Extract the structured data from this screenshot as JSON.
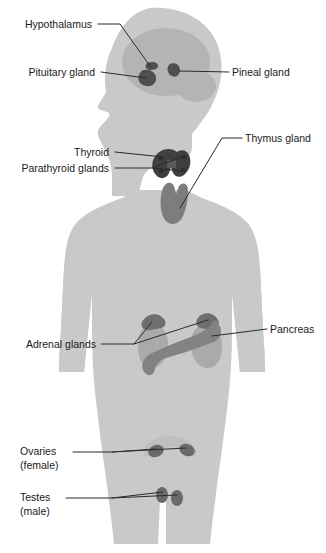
{
  "figure": {
    "orientation": "anterior body silhouette with left-facing head profile"
  },
  "colors": {
    "background": "#ffffff",
    "body_fill": "#c9c9c9",
    "body_fill_light": "#d0d0d0",
    "brain_fill": "#b4b4b4",
    "organ_mid": "#9a9a9a",
    "organ_dark": "#6e6e6e",
    "organ_darkest": "#4f4f4f",
    "uterus_faint": "#bcbcbc",
    "leader_line": "#2b2b2b",
    "label_text": "#1a1a1a"
  },
  "labels": [
    {
      "id": "hypothalamus",
      "text": "Hypothalamus",
      "lines": [
        "Hypothalamus"
      ],
      "side": "left",
      "align": "end",
      "x": 92,
      "y": 28,
      "region": "brain"
    },
    {
      "id": "pituitary-gland",
      "text": "Pituitary gland",
      "lines": [
        "Pituitary gland"
      ],
      "side": "left",
      "align": "end",
      "x": 95,
      "y": 76,
      "region": "brain"
    },
    {
      "id": "pineal-gland",
      "text": "Pineal gland",
      "lines": [
        "Pineal gland"
      ],
      "side": "right",
      "align": "start",
      "x": 232,
      "y": 76,
      "region": "brain"
    },
    {
      "id": "thyroid",
      "text": "Thyroid",
      "lines": [
        "Thyroid"
      ],
      "side": "left",
      "align": "end",
      "x": 109,
      "y": 156,
      "region": "neck"
    },
    {
      "id": "parathyroid-glands",
      "text": "Parathyroid glands",
      "lines": [
        "Parathyroid glands"
      ],
      "side": "left",
      "align": "end",
      "x": 109,
      "y": 172,
      "region": "neck"
    },
    {
      "id": "thymus-gland",
      "text": "Thymus gland",
      "lines": [
        "Thymus gland"
      ],
      "side": "right",
      "align": "start",
      "x": 245,
      "y": 142,
      "region": "chest"
    },
    {
      "id": "adrenal-glands",
      "text": "Adrenal glands",
      "lines": [
        "Adrenal glands"
      ],
      "side": "left",
      "align": "end",
      "x": 96,
      "y": 348,
      "region": "abdomen"
    },
    {
      "id": "pancreas",
      "text": "Pancreas",
      "lines": [
        "Pancreas"
      ],
      "side": "right",
      "align": "start",
      "x": 270,
      "y": 333,
      "region": "abdomen"
    },
    {
      "id": "ovaries",
      "text": "Ovaries (female)",
      "lines": [
        "Ovaries",
        "(female)"
      ],
      "side": "left",
      "align": "start",
      "x": 20,
      "y": 455,
      "region": "pelvis"
    },
    {
      "id": "testes",
      "text": "Testes (male)",
      "lines": [
        "Testes",
        "(male)"
      ],
      "side": "left",
      "align": "start",
      "x": 20,
      "y": 501,
      "region": "pelvis"
    }
  ],
  "glands": [
    {
      "id": "hypothalamus",
      "name": "Hypothalamus",
      "shade": "organ_darkest"
    },
    {
      "id": "pituitary-gland",
      "name": "Pituitary gland",
      "shade": "organ_darkest"
    },
    {
      "id": "pineal-gland",
      "name": "Pineal gland",
      "shade": "organ_darkest"
    },
    {
      "id": "thyroid",
      "name": "Thyroid",
      "shade": "organ_darkest"
    },
    {
      "id": "parathyroid-glands",
      "name": "Parathyroid glands",
      "shade": "organ_darkest"
    },
    {
      "id": "thymus-gland",
      "name": "Thymus gland",
      "shade": "organ_dark"
    },
    {
      "id": "adrenal-glands",
      "name": "Adrenal glands",
      "shade": "organ_dark"
    },
    {
      "id": "kidneys",
      "name": "Kidneys",
      "shade": "organ_mid"
    },
    {
      "id": "pancreas",
      "name": "Pancreas",
      "shade": "organ_dark"
    },
    {
      "id": "ovaries",
      "name": "Ovaries",
      "shade": "organ_dark"
    },
    {
      "id": "uterus",
      "name": "Uterus",
      "shade": "uterus_faint"
    },
    {
      "id": "testes",
      "name": "Testes",
      "shade": "organ_dark"
    }
  ]
}
